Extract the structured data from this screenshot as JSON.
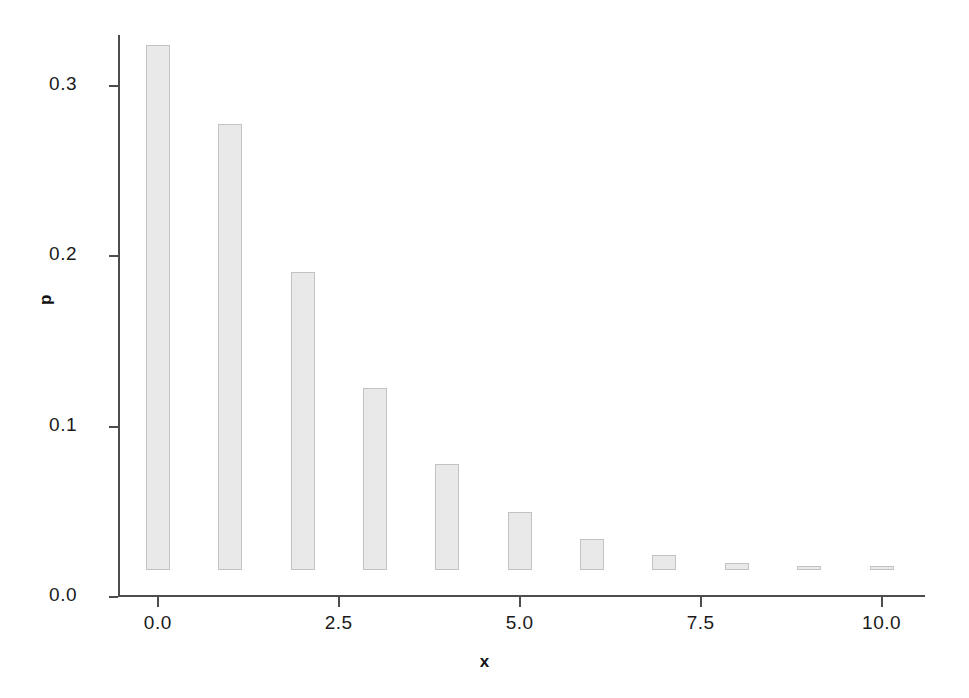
{
  "chart_data": {
    "type": "bar",
    "title": "",
    "subtitle": "",
    "xlabel": "x",
    "ylabel": "p",
    "x": [
      0,
      1,
      2,
      3,
      4,
      5,
      6,
      7,
      8,
      9,
      10
    ],
    "values": [
      0.308,
      0.262,
      0.175,
      0.107,
      0.062,
      0.034,
      0.018,
      0.009,
      0.004,
      0.002,
      0.001
    ],
    "categories": [
      "0",
      "1",
      "2",
      "3",
      "4",
      "5",
      "6",
      "7",
      "8",
      "9",
      "10"
    ],
    "xlim": [
      -0.55,
      10.6
    ],
    "ylim": [
      0.0,
      0.33
    ],
    "xticks": [
      0.0,
      2.5,
      5.0,
      7.5,
      10.0
    ],
    "xtick_labels": [
      "0.0",
      "2.5",
      "5.0",
      "7.5",
      "10.0"
    ],
    "yticks": [
      0.0,
      0.1,
      0.2,
      0.3
    ],
    "ytick_labels": [
      "0.0",
      "0.1",
      "0.2",
      "0.3"
    ],
    "grid": false,
    "legend": null,
    "legend_position": "none",
    "bar_fill_color": "#e9e9e9",
    "bar_edge_color": "#c2c2c2",
    "axis_color": "#4d4d4d",
    "text_color": "#1a1a1a",
    "background_color": "#ffffff",
    "annotations": []
  }
}
